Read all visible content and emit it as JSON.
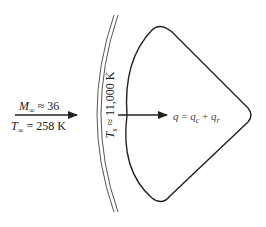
{
  "diagram": {
    "freestream": {
      "mach_symbol": "M",
      "mach_subscript": "∞",
      "mach_relation": " ≈ 36",
      "temp_symbol": "T",
      "temp_subscript": "∞",
      "temp_relation": " = 258 K"
    },
    "shock_layer": {
      "temp_symbol": "T",
      "temp_subscript": "s",
      "temp_relation": " ≈ 11,000 K"
    },
    "heat_flux": {
      "q": "q",
      "equals": " = ",
      "qc": "q",
      "qc_sub": "c",
      "plus": " + ",
      "qr": "q",
      "qr_sub": "r"
    },
    "colors": {
      "stroke": "#222222",
      "shock": "#555555",
      "background": "#ffffff"
    }
  }
}
